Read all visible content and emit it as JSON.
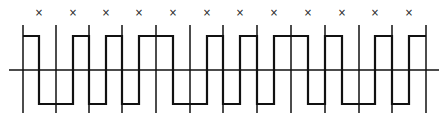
{
  "diagram": {
    "type": "waveform",
    "colors": {
      "background": "#ffffff",
      "stroke": "#111111",
      "mark": "#222222"
    },
    "axis": {
      "y": 70,
      "x_start": 9,
      "x_end": 439
    },
    "levels": {
      "high": 36,
      "low": 104
    },
    "clock_lines": {
      "y_top": 25,
      "y_bottom": 113,
      "x": [
        23,
        56,
        89,
        122,
        156,
        190,
        223,
        257,
        291,
        325,
        359,
        392,
        426
      ]
    },
    "sample_marks": {
      "glyph": "×",
      "y": 13,
      "x": [
        39,
        73,
        106,
        139,
        173,
        207,
        240,
        274,
        308,
        342,
        375,
        409
      ]
    },
    "waveform_segments": [
      {
        "x0": 23,
        "x1": 39,
        "level": "high"
      },
      {
        "x0": 39,
        "x1": 73,
        "level": "low"
      },
      {
        "x0": 73,
        "x1": 89,
        "level": "high"
      },
      {
        "x0": 89,
        "x1": 106,
        "level": "low"
      },
      {
        "x0": 106,
        "x1": 122,
        "level": "high"
      },
      {
        "x0": 122,
        "x1": 139,
        "level": "low"
      },
      {
        "x0": 139,
        "x1": 173,
        "level": "high"
      },
      {
        "x0": 173,
        "x1": 207,
        "level": "low"
      },
      {
        "x0": 207,
        "x1": 223,
        "level": "high"
      },
      {
        "x0": 223,
        "x1": 240,
        "level": "low"
      },
      {
        "x0": 240,
        "x1": 257,
        "level": "high"
      },
      {
        "x0": 257,
        "x1": 274,
        "level": "low"
      },
      {
        "x0": 274,
        "x1": 308,
        "level": "high"
      },
      {
        "x0": 308,
        "x1": 325,
        "level": "low"
      },
      {
        "x0": 325,
        "x1": 342,
        "level": "high"
      },
      {
        "x0": 342,
        "x1": 375,
        "level": "low"
      },
      {
        "x0": 375,
        "x1": 392,
        "level": "high"
      },
      {
        "x0": 392,
        "x1": 409,
        "level": "low"
      },
      {
        "x0": 409,
        "x1": 426,
        "level": "high"
      }
    ]
  }
}
